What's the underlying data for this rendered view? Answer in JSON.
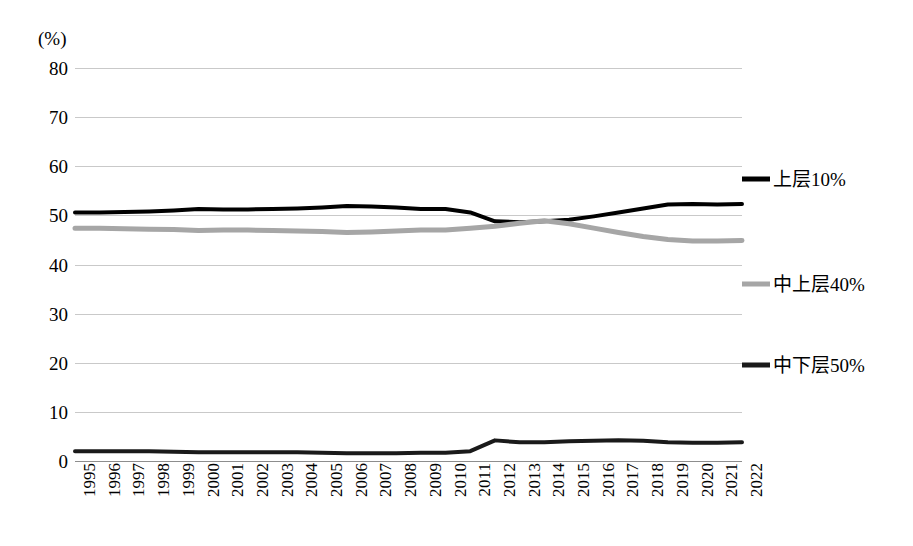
{
  "chart_data": {
    "type": "line",
    "title": "",
    "subtitle": "",
    "xlabel": "",
    "ylabel": "(%)",
    "y_unit_label": "(%)",
    "xlim": [
      1995,
      2022
    ],
    "ylim": [
      0,
      80
    ],
    "y_ticks": [
      0,
      10,
      20,
      30,
      40,
      50,
      60,
      70,
      80
    ],
    "grid": "horizontal",
    "legend_position": "right",
    "x": [
      1995,
      1996,
      1997,
      1998,
      1999,
      2000,
      2001,
      2002,
      2003,
      2004,
      2005,
      2006,
      2007,
      2008,
      2009,
      2010,
      2011,
      2012,
      2013,
      2014,
      2015,
      2016,
      2017,
      2018,
      2019,
      2020,
      2021,
      2022
    ],
    "categories": [
      "1995",
      "1996",
      "1997",
      "1998",
      "1999",
      "2000",
      "2001",
      "2002",
      "2003",
      "2004",
      "2005",
      "2006",
      "2007",
      "2008",
      "2009",
      "2010",
      "2011",
      "2012",
      "2013",
      "2014",
      "2015",
      "2016",
      "2017",
      "2018",
      "2019",
      "2020",
      "2021",
      "2022"
    ],
    "series": [
      {
        "name": "上层10%",
        "color": "#000000",
        "width": 4,
        "values": [
          50.6,
          50.6,
          50.7,
          50.8,
          51.0,
          51.3,
          51.2,
          51.2,
          51.3,
          51.4,
          51.6,
          51.9,
          51.8,
          51.6,
          51.3,
          51.3,
          50.6,
          48.8,
          48.6,
          48.8,
          49.1,
          49.8,
          50.6,
          51.4,
          52.2,
          52.3,
          52.2,
          52.3
        ]
      },
      {
        "name": "中上层40%",
        "color": "#a6a6a6",
        "width": 5,
        "values": [
          47.4,
          47.4,
          47.3,
          47.2,
          47.1,
          46.9,
          47.0,
          47.0,
          46.9,
          46.8,
          46.7,
          46.5,
          46.6,
          46.8,
          47.0,
          47.0,
          47.4,
          47.8,
          48.4,
          48.9,
          48.3,
          47.4,
          46.5,
          45.7,
          45.1,
          44.8,
          44.8,
          44.9
        ]
      },
      {
        "name": "中下层50%",
        "color": "#1a1a1a",
        "width": 4,
        "values": [
          2.0,
          2.0,
          2.0,
          2.0,
          1.9,
          1.8,
          1.8,
          1.8,
          1.8,
          1.8,
          1.7,
          1.6,
          1.6,
          1.6,
          1.7,
          1.7,
          2.0,
          4.2,
          3.8,
          3.8,
          4.0,
          4.1,
          4.2,
          4.1,
          3.8,
          3.7,
          3.7,
          3.8
        ]
      }
    ]
  },
  "legend": {
    "entries": [
      {
        "label": "上层10%",
        "color": "#000000",
        "y_value": 57.5
      },
      {
        "label": "中上层40%",
        "color": "#a6a6a6",
        "y_value": 36.0
      },
      {
        "label": "中下层50%",
        "color": "#1a1a1a",
        "y_value": 19.5
      }
    ]
  },
  "axes": {
    "y_unit": "(%)",
    "y_tick_labels": [
      "80",
      "70",
      "60",
      "50",
      "40",
      "30",
      "20",
      "10",
      "0"
    ],
    "x_tick_labels": [
      "1995",
      "1996",
      "1997",
      "1998",
      "1999",
      "2000",
      "2001",
      "2002",
      "2003",
      "2004",
      "2005",
      "2006",
      "2007",
      "2008",
      "2009",
      "2010",
      "2011",
      "2012",
      "2013",
      "2014",
      "2015",
      "2016",
      "2017",
      "2018",
      "2019",
      "2020",
      "2021",
      "2022"
    ]
  },
  "colors": {
    "gridline": "#c9c9c9",
    "baseline": "#8d8d8d",
    "background": "#ffffff",
    "series_top": "#000000",
    "series_middle": "#a6a6a6",
    "series_bottom": "#1a1a1a"
  }
}
